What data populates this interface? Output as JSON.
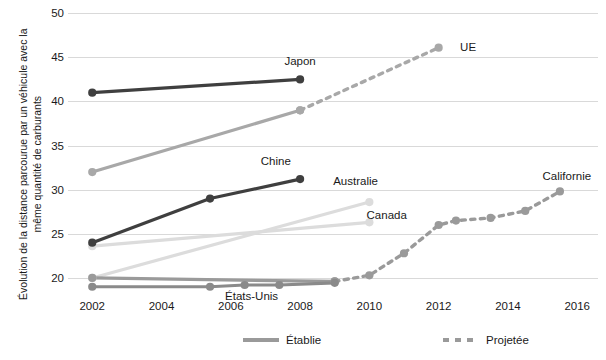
{
  "chart_data": {
    "type": "line",
    "title": "",
    "xlabel": "",
    "ylabel": "Évolution de la distance parcourue par un véhicule avec la même quantité de carburants",
    "xlim": [
      2001.3,
      2016.6
    ],
    "ylim": [
      17.5,
      51.5
    ],
    "xticks": [
      "2002",
      "2004",
      "2006",
      "2008",
      "2010",
      "2012",
      "2014",
      "2016"
    ],
    "xtick_values": [
      2002,
      2004,
      2006,
      2008,
      2010,
      2012,
      2014,
      2016
    ],
    "yticks": [
      "20",
      "25",
      "30",
      "35",
      "40",
      "45",
      "50"
    ],
    "ytick_values": [
      20,
      25,
      30,
      35,
      40,
      45,
      50
    ],
    "grid": true,
    "grid_axis": "y",
    "legend_position": "bottom",
    "legend": [
      {
        "label": "Établie",
        "style": "solid",
        "color": "#9a9a9a"
      },
      {
        "label": "Projetée",
        "style": "dashed",
        "color": "#9a9a9a"
      }
    ],
    "series": [
      {
        "name": "Japon",
        "color": "#3f3f3f",
        "label_x": 2008.0,
        "label_y": 44.6,
        "established": {
          "x": [
            2002,
            2008
          ],
          "y": [
            41.0,
            42.5
          ]
        },
        "projected": {
          "x": [],
          "y": []
        }
      },
      {
        "name": "UE",
        "color": "#a8a8a8",
        "label_x": 2012.85,
        "label_y": 46.2,
        "established": {
          "x": [
            2002,
            2008
          ],
          "y": [
            32.0,
            39.0
          ]
        },
        "projected": {
          "x": [
            2008,
            2012
          ],
          "y": [
            39.0,
            46.1
          ]
        }
      },
      {
        "name": "Chine",
        "color": "#3f3f3f",
        "label_x": 2007.3,
        "label_y": 33.2,
        "established": {
          "x": [
            2002,
            2005.4,
            2008
          ],
          "y": [
            24.0,
            29.0,
            31.2
          ]
        },
        "projected": {
          "x": [],
          "y": []
        }
      },
      {
        "name": "Australie",
        "color": "#dcdcdc",
        "label_x": 2009.6,
        "label_y": 31.0,
        "established": {
          "x": [
            2002,
            2010
          ],
          "y": [
            20.0,
            28.6
          ]
        },
        "projected": {
          "x": [],
          "y": []
        }
      },
      {
        "name": "Canada",
        "color": "#dcdcdc",
        "label_x": 2010.5,
        "label_y": 27.1,
        "established": {
          "x": [
            2002,
            2010
          ],
          "y": [
            23.6,
            26.3
          ]
        },
        "projected": {
          "x": [],
          "y": []
        }
      },
      {
        "name": "Californie",
        "color": "#9a9a9a",
        "label_x": 2015.7,
        "label_y": 31.6,
        "established": {
          "x": [
            2002,
            2009
          ],
          "y": [
            20.0,
            19.6
          ]
        },
        "projected": {
          "x": [
            2009,
            2010,
            2011,
            2012,
            2012.5,
            2013.5,
            2014.5,
            2015.5
          ],
          "y": [
            19.6,
            20.3,
            22.8,
            26.0,
            26.5,
            26.8,
            27.6,
            29.8
          ]
        }
      },
      {
        "name": "États-Unis",
        "color": "#8a8a8a",
        "label_x": 2006.6,
        "label_y": 17.9,
        "established": {
          "x": [
            2002,
            2005.4,
            2006.4,
            2007.4,
            2009
          ],
          "y": [
            19.0,
            19.0,
            19.2,
            19.2,
            19.45
          ]
        },
        "projected": {
          "x": [],
          "y": []
        }
      }
    ]
  }
}
